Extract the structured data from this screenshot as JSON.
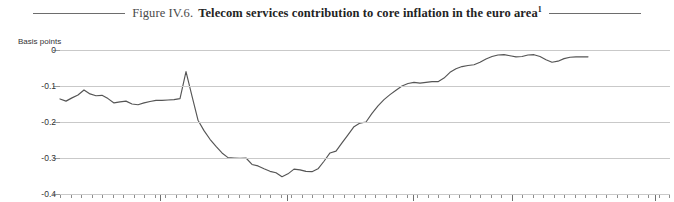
{
  "title": {
    "figure_label": "Figure IV.6.",
    "main": "Telecom services contribution to core inflation in the euro area",
    "footnote_marker": "1"
  },
  "chart_data": {
    "type": "line",
    "title": "Telecom services contribution to core inflation in the euro area",
    "xlabel": "",
    "ylabel": "Basis points",
    "unit_label": "Basis points",
    "ylim": [
      -0.4,
      0
    ],
    "yticks": [
      0,
      -0.1,
      -0.2,
      -0.3,
      -0.4
    ],
    "ytick_labels": [
      "0",
      "-0.1",
      "-0.2",
      "-0.3",
      "-0.4"
    ],
    "grid": true,
    "legend": "none",
    "xtick_major_labels": [
      "1999",
      "2000",
      "01",
      "02",
      "03"
    ],
    "xtick_major_positions": [
      100,
      227,
      353,
      452,
      595
    ],
    "xlim_positions": [
      0,
      610
    ],
    "series": [
      {
        "name": "Telecom services contribution to core inflation",
        "color": "#555555",
        "points": [
          [
            0,
            -0.136
          ],
          [
            6,
            -0.142
          ],
          [
            12,
            -0.133
          ],
          [
            18,
            -0.125
          ],
          [
            24,
            -0.111
          ],
          [
            30,
            -0.122
          ],
          [
            36,
            -0.127
          ],
          [
            42,
            -0.126
          ],
          [
            48,
            -0.135
          ],
          [
            54,
            -0.147
          ],
          [
            60,
            -0.144
          ],
          [
            66,
            -0.142
          ],
          [
            72,
            -0.15
          ],
          [
            78,
            -0.152
          ],
          [
            84,
            -0.147
          ],
          [
            90,
            -0.143
          ],
          [
            96,
            -0.14
          ],
          [
            102,
            -0.14
          ],
          [
            108,
            -0.139
          ],
          [
            114,
            -0.138
          ],
          [
            120,
            -0.135
          ],
          [
            126,
            -0.06
          ],
          [
            132,
            -0.128
          ],
          [
            138,
            -0.195
          ],
          [
            144,
            -0.224
          ],
          [
            150,
            -0.248
          ],
          [
            156,
            -0.268
          ],
          [
            162,
            -0.286
          ],
          [
            168,
            -0.299
          ],
          [
            174,
            -0.3
          ],
          [
            180,
            -0.301
          ],
          [
            186,
            -0.3
          ],
          [
            192,
            -0.318
          ],
          [
            198,
            -0.322
          ],
          [
            204,
            -0.33
          ],
          [
            210,
            -0.337
          ],
          [
            216,
            -0.341
          ],
          [
            222,
            -0.352
          ],
          [
            228,
            -0.344
          ],
          [
            234,
            -0.331
          ],
          [
            240,
            -0.333
          ],
          [
            246,
            -0.337
          ],
          [
            252,
            -0.338
          ],
          [
            258,
            -0.33
          ],
          [
            264,
            -0.309
          ],
          [
            270,
            -0.286
          ],
          [
            276,
            -0.281
          ],
          [
            282,
            -0.258
          ],
          [
            288,
            -0.236
          ],
          [
            294,
            -0.213
          ],
          [
            300,
            -0.203
          ],
          [
            306,
            -0.2
          ],
          [
            312,
            -0.176
          ],
          [
            318,
            -0.155
          ],
          [
            324,
            -0.138
          ],
          [
            330,
            -0.124
          ],
          [
            336,
            -0.112
          ],
          [
            342,
            -0.1
          ],
          [
            348,
            -0.093
          ],
          [
            354,
            -0.09
          ],
          [
            360,
            -0.092
          ],
          [
            366,
            -0.09
          ],
          [
            372,
            -0.088
          ],
          [
            378,
            -0.088
          ],
          [
            384,
            -0.078
          ],
          [
            390,
            -0.062
          ],
          [
            396,
            -0.052
          ],
          [
            402,
            -0.046
          ],
          [
            408,
            -0.043
          ],
          [
            414,
            -0.041
          ],
          [
            420,
            -0.034
          ],
          [
            426,
            -0.025
          ],
          [
            432,
            -0.018
          ],
          [
            438,
            -0.014
          ],
          [
            444,
            -0.013
          ],
          [
            450,
            -0.016
          ],
          [
            456,
            -0.019
          ],
          [
            462,
            -0.018
          ],
          [
            468,
            -0.014
          ],
          [
            474,
            -0.013
          ],
          [
            480,
            -0.018
          ],
          [
            486,
            -0.027
          ],
          [
            492,
            -0.034
          ],
          [
            498,
            -0.031
          ],
          [
            504,
            -0.024
          ],
          [
            510,
            -0.02
          ],
          [
            516,
            -0.019
          ],
          [
            522,
            -0.019
          ],
          [
            528,
            -0.019
          ]
        ]
      }
    ]
  }
}
